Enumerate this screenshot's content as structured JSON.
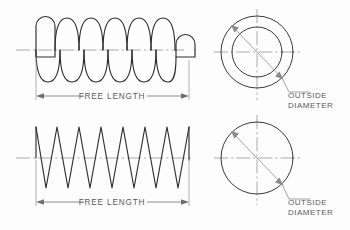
{
  "drawing": {
    "title": "Helical Compression Spring — Dimension Reference Drawing",
    "background_color": "#fdfdfd",
    "object_line_color": "#2e2e2e",
    "center_line_color": "#8e8e8e",
    "dimension_line_color": "#6f6f6f",
    "text_color": "#5a5a5a"
  },
  "views": {
    "top_left": {
      "name": "helical-spring-side-view",
      "representation": "true-helix-outline",
      "coil_count": 7,
      "end_type": "closed-and-ground",
      "dimension_label": "FREE LENGTH"
    },
    "bottom_left": {
      "name": "schematic-spring-side-view",
      "representation": "zigzag-schematic",
      "coil_count": 8,
      "dimension_label": "FREE LENGTH"
    },
    "top_right": {
      "name": "spring-end-view-concentric",
      "representation": "two-concentric-circles",
      "circle_count": 2,
      "leader_label_line1": "OUTSIDE",
      "leader_label_line2": "DIAMETER"
    },
    "bottom_right": {
      "name": "spring-end-view-single",
      "representation": "single-circle",
      "circle_count": 1,
      "leader_label_line1": "OUTSIDE",
      "leader_label_line2": "DIAMETER"
    }
  },
  "labels": {
    "free_length_top": "FREE LENGTH",
    "free_length_bottom": "FREE LENGTH",
    "outside_top_1": "OUTSIDE",
    "outside_top_2": "DIAMETER",
    "outside_bottom_1": "OUTSIDE",
    "outside_bottom_2": "DIAMETER"
  }
}
